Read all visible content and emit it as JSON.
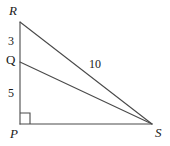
{
  "figure": {
    "type": "geometry-diagram",
    "background_color": "#ffffff",
    "stroke_color": "#4a4a4a",
    "text_color": "#1a1a1a",
    "width": 170,
    "height": 146,
    "vertices": [
      {
        "name": "R",
        "label": "R",
        "x": 20,
        "y": 22,
        "label_x": 9,
        "label_y": 4,
        "italic": true
      },
      {
        "name": "Q",
        "label": "Q",
        "x": 20,
        "y": 62,
        "label_x": 6,
        "label_y": 53,
        "italic": false
      },
      {
        "name": "P",
        "label": "P",
        "x": 20,
        "y": 124,
        "label_x": 10,
        "label_y": 127,
        "italic": true
      },
      {
        "name": "S",
        "label": "S",
        "x": 152,
        "y": 124,
        "label_x": 155,
        "label_y": 126,
        "italic": true
      }
    ],
    "segments": [
      {
        "name": "RP",
        "from": "R",
        "to": "P",
        "x1": 20,
        "y1": 22,
        "x2": 20,
        "y2": 124
      },
      {
        "name": "PS",
        "from": "P",
        "to": "S",
        "x1": 20,
        "y1": 124,
        "x2": 152,
        "y2": 124
      },
      {
        "name": "RS",
        "from": "R",
        "to": "S",
        "x1": 20,
        "y1": 22,
        "x2": 152,
        "y2": 124
      },
      {
        "name": "QS",
        "from": "Q",
        "to": "S",
        "x1": 20,
        "y1": 62,
        "x2": 152,
        "y2": 124
      }
    ],
    "segment_labels": [
      {
        "name": "RQ",
        "value": "3",
        "x": 8,
        "y": 35
      },
      {
        "name": "QP",
        "value": "5",
        "x": 8,
        "y": 87
      },
      {
        "name": "RS",
        "value": "10",
        "x": 89,
        "y": 58
      }
    ],
    "right_angle": {
      "at_vertex": "P",
      "x": 20,
      "y": 113,
      "size": 10
    }
  }
}
